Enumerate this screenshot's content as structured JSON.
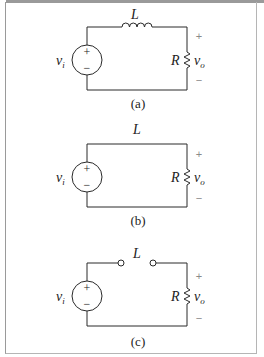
{
  "figure": {
    "panels": [
      {
        "id": "a",
        "caption": "(a)",
        "inductor_label": "L",
        "inductor_state": "coil",
        "resistor_label": "R",
        "source_label_main": "v",
        "source_label_sub": "i",
        "output_label_main": "v",
        "output_label_sub": "o",
        "plus": "+",
        "minus": "−",
        "source_plus": "+",
        "source_minus": "−"
      },
      {
        "id": "b",
        "caption": "(b)",
        "inductor_label": "L",
        "inductor_state": "short circuit",
        "resistor_label": "R",
        "source_label_main": "v",
        "source_label_sub": "i",
        "output_label_main": "v",
        "output_label_sub": "o",
        "plus": "+",
        "minus": "−",
        "source_plus": "+",
        "source_minus": "−"
      },
      {
        "id": "c",
        "caption": "(c)",
        "inductor_label": "L",
        "inductor_state": "open circuit",
        "resistor_label": "R",
        "source_label_main": "v",
        "source_label_sub": "i",
        "output_label_main": "v",
        "output_label_sub": "o",
        "plus": "+",
        "minus": "−",
        "source_plus": "+",
        "source_minus": "−"
      }
    ],
    "colors": {
      "wire": "#2a2a2a",
      "text": "#222222",
      "sign": "#8a8a8a",
      "border": "#9a9a9a"
    }
  }
}
